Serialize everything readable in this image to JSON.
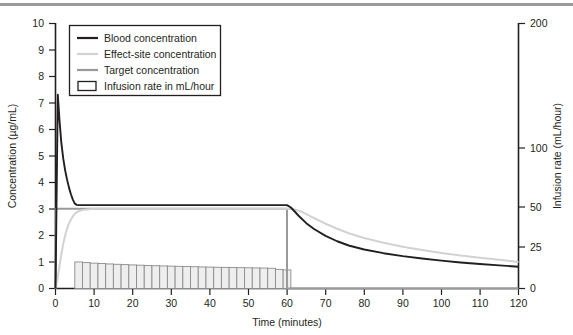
{
  "figure": {
    "top_rule_color": "#9a9a9a",
    "background": "#ffffff"
  },
  "legend": {
    "items": [
      {
        "label": "Blood concentration",
        "marker": "line",
        "color": "#231f20"
      },
      {
        "label": "Effect-site concentration",
        "marker": "line",
        "color": "#d2d2d2"
      },
      {
        "label": "Target concentration",
        "marker": "line",
        "color": "#9a9a9a"
      },
      {
        "label": "Infusion rate in mL/hour",
        "marker": "rect",
        "color": "#231f20"
      }
    ]
  },
  "axes": {
    "left_title": "Concentration (µg/mL)",
    "right_title": "Infusion rate (mL/hour)",
    "x_title": "Time (minutes)",
    "left_ticks": [
      "0",
      "1",
      "2",
      "3",
      "4",
      "5",
      "6",
      "7",
      "8",
      "9",
      "10"
    ],
    "right_ticks": [
      "0",
      "25",
      "50",
      "100",
      "200"
    ],
    "x_ticks": [
      "0",
      "10",
      "20",
      "30",
      "40",
      "50",
      "60",
      "70",
      "80",
      "90",
      "100",
      "110",
      "120"
    ]
  },
  "chart_data": {
    "type": "line",
    "title": "",
    "xlabel": "Time (minutes)",
    "ylabel": "Concentration (µg/mL)",
    "y2label": "Infusion rate (mL/hour)",
    "xlim": [
      0,
      120
    ],
    "ylim": [
      0,
      10
    ],
    "y2lim": [
      0,
      200
    ],
    "y2_scale": "nonlinear",
    "y2_tick_values": [
      0,
      25,
      50,
      100,
      200
    ],
    "grid": false,
    "legend_position": "upper-left-inside",
    "series": [
      {
        "name": "Blood concentration",
        "color": "#231f20",
        "x": [
          0,
          0.2,
          0.4,
          0.6,
          0.8,
          1.0,
          1.5,
          2,
          2.5,
          3,
          3.5,
          4,
          4.5,
          5,
          5.5,
          6,
          8,
          10,
          15,
          20,
          25,
          30,
          35,
          40,
          45,
          50,
          55,
          60,
          61,
          62,
          63,
          65,
          67,
          70,
          73,
          76,
          80,
          85,
          90,
          95,
          100,
          105,
          110,
          115,
          120
        ],
        "y": [
          0,
          2.4,
          4.9,
          7.3,
          6.85,
          6.4,
          5.5,
          4.9,
          4.45,
          4.1,
          3.8,
          3.55,
          3.35,
          3.2,
          3.15,
          3.14,
          3.14,
          3.14,
          3.14,
          3.14,
          3.14,
          3.14,
          3.14,
          3.14,
          3.14,
          3.14,
          3.14,
          3.14,
          3.05,
          2.9,
          2.74,
          2.46,
          2.24,
          1.98,
          1.78,
          1.62,
          1.47,
          1.33,
          1.22,
          1.13,
          1.05,
          0.98,
          0.92,
          0.87,
          0.82
        ]
      },
      {
        "name": "Effect-site concentration",
        "color": "#d2d2d2",
        "x": [
          0,
          0.5,
          1,
          1.5,
          2,
          2.5,
          3,
          3.5,
          4,
          4.5,
          5,
          5.5,
          6,
          7,
          8,
          10,
          15,
          20,
          30,
          40,
          50,
          60,
          62,
          64,
          66,
          68,
          70,
          73,
          76,
          80,
          85,
          90,
          95,
          100,
          105,
          110,
          115,
          120
        ],
        "y": [
          0,
          0.35,
          0.82,
          1.28,
          1.68,
          2.0,
          2.25,
          2.45,
          2.6,
          2.72,
          2.81,
          2.87,
          2.91,
          2.96,
          2.98,
          3.0,
          3.0,
          3.0,
          3.0,
          3.0,
          3.0,
          3.0,
          2.98,
          2.88,
          2.73,
          2.58,
          2.44,
          2.25,
          2.08,
          1.9,
          1.72,
          1.57,
          1.45,
          1.34,
          1.24,
          1.16,
          1.08,
          1.0
        ]
      },
      {
        "name": "Target concentration",
        "color": "#9a9a9a",
        "x": [
          0,
          0.05,
          60,
          60,
          120
        ],
        "y": [
          0,
          3.0,
          3.0,
          0,
          0
        ]
      }
    ],
    "bars": {
      "name": "Infusion rate in mL/hour",
      "fill": "#eeeeee",
      "edge": "#8c8c8c",
      "bar_width_minutes": 2,
      "x_left": [
        5,
        7,
        9,
        11,
        13,
        15,
        17,
        19,
        21,
        23,
        25,
        27,
        29,
        31,
        33,
        35,
        37,
        39,
        41,
        43,
        45,
        47,
        49,
        51,
        53,
        55,
        57,
        59
      ],
      "values_left_axis_units": [
        1.0,
        0.975,
        0.955,
        0.94,
        0.925,
        0.912,
        0.9,
        0.888,
        0.878,
        0.868,
        0.858,
        0.85,
        0.842,
        0.835,
        0.828,
        0.82,
        0.812,
        0.806,
        0.8,
        0.795,
        0.79,
        0.785,
        0.78,
        0.775,
        0.77,
        0.762,
        0.72,
        0.7
      ]
    },
    "annotations": [
      "Infusion begins at t = 0 with a loading bolus; blood concentration peaks near 7.3 µg/mL at about t = 0.6 min.",
      "Target concentration is held at 3.0 µg/mL from t = 0 to t = 60 min.",
      "Infusion stops at t = 60 min; both blood and effect-site concentrations decay thereafter."
    ]
  }
}
